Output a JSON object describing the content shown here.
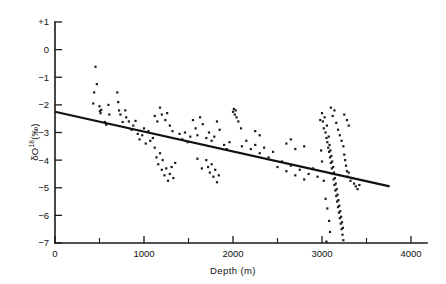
{
  "figure": {
    "background_color": "#ffffff",
    "ink_color": "#1a1a1a"
  },
  "axes": {
    "x_title": "Depth  (m)",
    "y_title_prefix": "δO",
    "y_title_superscript": "18",
    "y_title_suffix": "(‰)",
    "x_tick_labels": [
      "0",
      "1000",
      "2000",
      "3000",
      "4000"
    ],
    "y_tick_labels": [
      "+1",
      "0",
      "−1",
      "−2",
      "−3",
      "−4",
      "−5",
      "−6",
      "−7"
    ]
  },
  "chart_data": {
    "type": "scatter",
    "title": "",
    "xlabel": "Depth  (m)",
    "ylabel": "δO18(‰)",
    "xlim": [
      0,
      4100
    ],
    "ylim": [
      -7,
      1
    ],
    "x_ticks": [
      0,
      1000,
      2000,
      3000,
      4000
    ],
    "x_minor_ticks": [
      500,
      1500,
      2500,
      3500
    ],
    "y_ticks": [
      1,
      0,
      -1,
      -2,
      -3,
      -4,
      -5,
      -6,
      -7
    ],
    "grid": false,
    "legend": null,
    "series": [
      {
        "name": "delta-O18 vs depth",
        "marker": "square",
        "marker_size_px": 2.2,
        "color": "#1a1a1a",
        "points": [
          [
            455,
            -0.62
          ],
          [
            430,
            -1.95
          ],
          [
            470,
            -1.25
          ],
          [
            440,
            -1.55
          ],
          [
            500,
            -2.05
          ],
          [
            505,
            -2.22
          ],
          [
            512,
            -2.3
          ],
          [
            520,
            -2.18
          ],
          [
            560,
            -2.62
          ],
          [
            575,
            -2.72
          ],
          [
            600,
            -2.0
          ],
          [
            610,
            -2.35
          ],
          [
            700,
            -1.55
          ],
          [
            710,
            -1.9
          ],
          [
            720,
            -2.2
          ],
          [
            735,
            -2.35
          ],
          [
            760,
            -2.62
          ],
          [
            790,
            -2.2
          ],
          [
            800,
            -2.45
          ],
          [
            830,
            -2.6
          ],
          [
            860,
            -2.9
          ],
          [
            880,
            -2.75
          ],
          [
            905,
            -2.58
          ],
          [
            930,
            -3.05
          ],
          [
            950,
            -3.25
          ],
          [
            980,
            -3.1
          ],
          [
            1000,
            -2.85
          ],
          [
            1020,
            -3.4
          ],
          [
            1050,
            -2.95
          ],
          [
            1070,
            -3.3
          ],
          [
            1100,
            -3.2
          ],
          [
            1120,
            -3.55
          ],
          [
            1140,
            -3.9
          ],
          [
            1160,
            -4.15
          ],
          [
            1180,
            -3.75
          ],
          [
            1200,
            -4.35
          ],
          [
            1210,
            -4.0
          ],
          [
            1230,
            -4.55
          ],
          [
            1250,
            -4.3
          ],
          [
            1270,
            -4.75
          ],
          [
            1290,
            -4.5
          ],
          [
            1310,
            -4.25
          ],
          [
            1330,
            -4.65
          ],
          [
            1350,
            -4.1
          ],
          [
            1120,
            -2.4
          ],
          [
            1150,
            -2.6
          ],
          [
            1180,
            -2.1
          ],
          [
            1200,
            -2.35
          ],
          [
            1240,
            -2.55
          ],
          [
            1260,
            -2.3
          ],
          [
            1290,
            -2.75
          ],
          [
            1320,
            -2.95
          ],
          [
            1400,
            -3.05
          ],
          [
            1430,
            -3.25
          ],
          [
            1460,
            -3.0
          ],
          [
            1490,
            -3.35
          ],
          [
            1520,
            -3.15
          ],
          [
            1550,
            -2.55
          ],
          [
            1580,
            -2.85
          ],
          [
            1600,
            -3.1
          ],
          [
            1630,
            -2.45
          ],
          [
            1660,
            -2.7
          ],
          [
            1700,
            -3.2
          ],
          [
            1730,
            -3.0
          ],
          [
            1760,
            -3.3
          ],
          [
            1790,
            -3.15
          ],
          [
            1820,
            -2.6
          ],
          [
            1850,
            -2.9
          ],
          [
            1700,
            -4.0
          ],
          [
            1720,
            -4.25
          ],
          [
            1740,
            -4.45
          ],
          [
            1760,
            -4.15
          ],
          [
            1780,
            -4.6
          ],
          [
            1800,
            -4.35
          ],
          [
            1820,
            -4.8
          ],
          [
            1840,
            -4.55
          ],
          [
            1600,
            -3.95
          ],
          [
            1650,
            -4.3
          ],
          [
            1900,
            -3.45
          ],
          [
            1930,
            -3.6
          ],
          [
            1960,
            -3.35
          ],
          [
            2000,
            -2.25
          ],
          [
            2010,
            -2.15
          ],
          [
            2020,
            -2.35
          ],
          [
            2030,
            -2.2
          ],
          [
            2040,
            -2.45
          ],
          [
            2060,
            -2.6
          ],
          [
            2090,
            -2.85
          ],
          [
            2100,
            -3.5
          ],
          [
            2150,
            -3.3
          ],
          [
            2200,
            -3.6
          ],
          [
            2250,
            -3.45
          ],
          [
            2300,
            -3.75
          ],
          [
            2350,
            -3.55
          ],
          [
            2400,
            -3.9
          ],
          [
            2450,
            -3.7
          ],
          [
            2250,
            -2.95
          ],
          [
            2300,
            -3.1
          ],
          [
            2500,
            -4.25
          ],
          [
            2550,
            -4.05
          ],
          [
            2600,
            -4.4
          ],
          [
            2650,
            -4.2
          ],
          [
            2700,
            -4.55
          ],
          [
            2750,
            -4.35
          ],
          [
            2800,
            -4.7
          ],
          [
            2850,
            -4.5
          ],
          [
            2900,
            -4.3
          ],
          [
            2950,
            -4.6
          ],
          [
            2600,
            -3.4
          ],
          [
            2650,
            -3.25
          ],
          [
            2700,
            -3.6
          ],
          [
            2800,
            -3.5
          ],
          [
            2980,
            -2.55
          ],
          [
            3000,
            -2.3
          ],
          [
            3010,
            -2.6
          ],
          [
            3020,
            -2.85
          ],
          [
            3030,
            -2.45
          ],
          [
            3040,
            -3.0
          ],
          [
            3050,
            -3.2
          ],
          [
            3055,
            -2.75
          ],
          [
            3060,
            -3.35
          ],
          [
            3070,
            -3.55
          ],
          [
            3075,
            -3.15
          ],
          [
            3080,
            -3.7
          ],
          [
            3085,
            -3.45
          ],
          [
            3090,
            -3.9
          ],
          [
            3095,
            -3.65
          ],
          [
            3100,
            -4.1
          ],
          [
            3105,
            -3.85
          ],
          [
            3110,
            -4.3
          ],
          [
            3115,
            -4.05
          ],
          [
            3120,
            -4.5
          ],
          [
            3125,
            -4.25
          ],
          [
            3130,
            -4.7
          ],
          [
            3135,
            -4.45
          ],
          [
            3140,
            -4.9
          ],
          [
            3145,
            -4.65
          ],
          [
            3150,
            -5.1
          ],
          [
            3155,
            -4.85
          ],
          [
            3160,
            -5.3
          ],
          [
            3165,
            -5.05
          ],
          [
            3170,
            -5.5
          ],
          [
            3175,
            -5.25
          ],
          [
            3180,
            -5.7
          ],
          [
            3185,
            -5.45
          ],
          [
            3190,
            -5.9
          ],
          [
            3195,
            -5.65
          ],
          [
            3200,
            -6.1
          ],
          [
            3205,
            -5.85
          ],
          [
            3210,
            -6.3
          ],
          [
            3215,
            -6.05
          ],
          [
            3220,
            -6.5
          ],
          [
            3225,
            -6.25
          ],
          [
            3230,
            -6.7
          ],
          [
            3235,
            -6.45
          ],
          [
            3240,
            -6.9
          ],
          [
            3100,
            -2.1
          ],
          [
            3120,
            -2.4
          ],
          [
            3140,
            -2.2
          ],
          [
            3160,
            -2.65
          ],
          [
            3180,
            -2.9
          ],
          [
            3200,
            -3.1
          ],
          [
            3220,
            -3.3
          ],
          [
            3240,
            -3.5
          ],
          [
            3250,
            -3.8
          ],
          [
            3260,
            -4.0
          ],
          [
            3270,
            -4.2
          ],
          [
            3280,
            -4.4
          ],
          [
            3290,
            -4.6
          ],
          [
            3300,
            -4.45
          ],
          [
            3320,
            -4.75
          ],
          [
            3340,
            -4.65
          ],
          [
            3360,
            -4.85
          ],
          [
            3380,
            -4.95
          ],
          [
            3400,
            -5.05
          ],
          [
            3420,
            -4.9
          ],
          [
            3250,
            -2.35
          ],
          [
            3280,
            -2.55
          ],
          [
            3300,
            -2.75
          ],
          [
            3040,
            -5.4
          ],
          [
            3060,
            -5.75
          ],
          [
            3080,
            -6.2
          ],
          [
            3090,
            -6.6
          ],
          [
            3050,
            -6.95
          ],
          [
            3020,
            -4.75
          ],
          [
            3000,
            -4.05
          ],
          [
            2990,
            -3.65
          ]
        ]
      }
    ],
    "trend_line": {
      "name": "linear regression",
      "x_start": 0,
      "y_start": -2.25,
      "x_end": 3760,
      "y_end": -4.95,
      "slope_per_1000m": -0.718,
      "intercept": -2.25,
      "color": "#111111"
    }
  }
}
